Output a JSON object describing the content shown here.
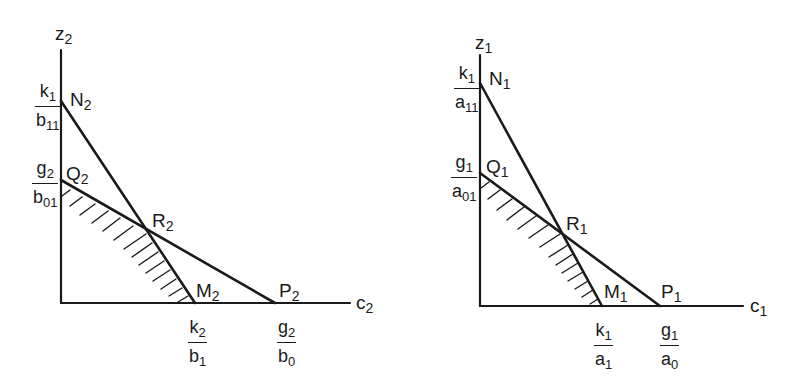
{
  "figures": [
    {
      "id": "left",
      "axis_y": {
        "var": "z",
        "sub": "2"
      },
      "axis_x": {
        "var": "c",
        "sub": "2"
      },
      "points": {
        "N": {
          "name": "N",
          "sub": "2"
        },
        "Q": {
          "name": "Q",
          "sub": "2"
        },
        "R": {
          "name": "R",
          "sub": "2"
        },
        "M": {
          "name": "M",
          "sub": "2"
        },
        "P": {
          "name": "P",
          "sub": "2"
        }
      },
      "intercepts": {
        "N": {
          "num": "k",
          "num_sub": "1",
          "den": "b",
          "den_sub": "11"
        },
        "Q": {
          "num": "g",
          "num_sub": "2",
          "den": "b",
          "den_sub": "01"
        },
        "M": {
          "num": "k",
          "num_sub": "2",
          "den": "b",
          "den_sub": "1"
        },
        "P": {
          "num": "g",
          "num_sub": "2",
          "den": "b",
          "den_sub": "0"
        }
      },
      "geometry": {
        "origin": [
          61,
          303
        ],
        "y_top": 50,
        "x_end": 350,
        "N": [
          61,
          101
        ],
        "Q": [
          61,
          180
        ],
        "R": [
          148,
          231
        ],
        "M": [
          195,
          303
        ],
        "P": [
          275,
          303
        ]
      }
    },
    {
      "id": "right",
      "axis_y": {
        "var": "z",
        "sub": "1"
      },
      "axis_x": {
        "var": "c",
        "sub": "1"
      },
      "points": {
        "N": {
          "name": "N",
          "sub": "1"
        },
        "Q": {
          "name": "Q",
          "sub": "1"
        },
        "R": {
          "name": "R",
          "sub": "1"
        },
        "M": {
          "name": "M",
          "sub": "1"
        },
        "P": {
          "name": "P",
          "sub": "1"
        }
      },
      "intercepts": {
        "N": {
          "num": "k",
          "num_sub": "1",
          "den": "a",
          "den_sub": "11"
        },
        "Q": {
          "num": "g",
          "num_sub": "1",
          "den": "a",
          "den_sub": "01"
        },
        "M": {
          "num": "k",
          "num_sub": "1",
          "den": "a",
          "den_sub": "1"
        },
        "P": {
          "num": "g",
          "num_sub": "1",
          "den": "a",
          "den_sub": "0"
        }
      },
      "geometry": {
        "origin": [
          480,
          306
        ],
        "y_top": 55,
        "x_end": 743,
        "N": [
          480,
          83
        ],
        "Q": [
          480,
          173
        ],
        "R": [
          563,
          236
        ],
        "M": [
          602,
          306
        ],
        "P": [
          660,
          306
        ]
      }
    }
  ],
  "colors": {
    "ink": "#1a1a1a",
    "background": "#ffffff"
  }
}
